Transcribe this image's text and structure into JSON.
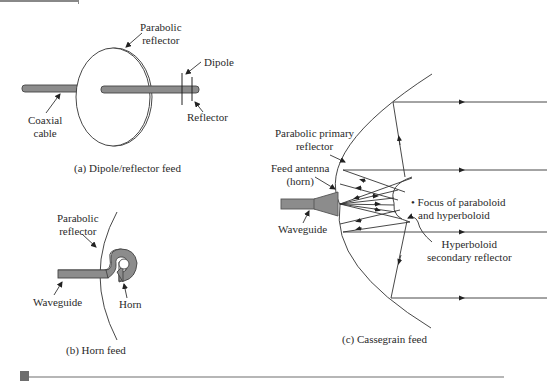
{
  "panels": {
    "a": {
      "caption": "(a) Dipole/reflector feed",
      "labels": {
        "parabolic_reflector_1": "Parabolic",
        "parabolic_reflector_2": "reflector",
        "dipole": "Dipole",
        "reflector": "Reflector",
        "coaxial_1": "Coaxial",
        "coaxial_2": "cable"
      }
    },
    "b": {
      "caption": "(b) Horn feed",
      "labels": {
        "parabolic_reflector_1": "Parabolic",
        "parabolic_reflector_2": "reflector",
        "waveguide": "Waveguide",
        "horn": "Horn"
      }
    },
    "c": {
      "caption": "(c) Cassegrain feed",
      "labels": {
        "primary_1": "Parabolic primary",
        "primary_2": "reflector",
        "feed_1": "Feed antenna",
        "feed_2": "(horn)",
        "waveguide": "Waveguide",
        "focus_1": "• Focus of paraboloid",
        "focus_2": "and hyperboloid",
        "secondary_1": "Hyperboloid",
        "secondary_2": "secondary reflector"
      }
    }
  },
  "colors": {
    "line": "#333333",
    "fill_gray": "#8c8c8c",
    "rule": "#6e6e6e"
  }
}
